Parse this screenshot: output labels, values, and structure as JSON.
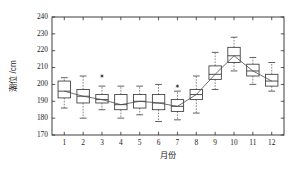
{
  "chart_data": {
    "type": "box",
    "title": "",
    "xlabel": "月份",
    "ylabel": "潮位 /cm",
    "xlim": [
      0.35,
      12.65
    ],
    "ylim": [
      170,
      240
    ],
    "yticks": [
      170,
      180,
      190,
      200,
      210,
      220,
      230,
      240
    ],
    "xticks": [
      1,
      2,
      3,
      4,
      5,
      6,
      7,
      8,
      9,
      10,
      11,
      12
    ],
    "xtick_labels": [
      "1",
      "2",
      "3",
      "4",
      "5",
      "6",
      "7",
      "8",
      "9",
      "10",
      "11",
      "12"
    ],
    "ytick_labels": [
      "170",
      "180",
      "190",
      "200",
      "210",
      "220",
      "230",
      "240"
    ],
    "grid": false,
    "legend": null,
    "categories": [
      "1",
      "2",
      "3",
      "4",
      "5",
      "6",
      "7",
      "8",
      "9",
      "10",
      "11",
      "12"
    ],
    "boxes": [
      {
        "category": "1",
        "whisker_low": 186,
        "q1": 192,
        "median": 196,
        "q3": 202,
        "whisker_high": 204,
        "outliers": []
      },
      {
        "category": "2",
        "whisker_low": 180,
        "q1": 189,
        "median": 193,
        "q3": 197,
        "whisker_high": 205,
        "outliers": []
      },
      {
        "category": "3",
        "whisker_low": 185,
        "q1": 189,
        "median": 191,
        "q3": 194,
        "whisker_high": 199,
        "outliers": [
          205
        ]
      },
      {
        "category": "4",
        "whisker_low": 180,
        "q1": 185,
        "median": 188,
        "q3": 194,
        "whisker_high": 199,
        "outliers": []
      },
      {
        "category": "5",
        "whisker_low": 182,
        "q1": 186,
        "median": 190,
        "q3": 194,
        "whisker_high": 199,
        "outliers": []
      },
      {
        "category": "6",
        "whisker_low": 178,
        "q1": 185,
        "median": 189,
        "q3": 194,
        "whisker_high": 200,
        "outliers": []
      },
      {
        "category": "7",
        "whisker_low": 179,
        "q1": 184,
        "median": 187,
        "q3": 191,
        "whisker_high": 196,
        "outliers": [
          199
        ]
      },
      {
        "category": "8",
        "whisker_low": 183,
        "q1": 191,
        "median": 194,
        "q3": 197,
        "whisker_high": 205,
        "outliers": []
      },
      {
        "category": "9",
        "whisker_low": 197,
        "q1": 203,
        "median": 206,
        "q3": 211,
        "whisker_high": 219,
        "outliers": []
      },
      {
        "category": "10",
        "whisker_low": 208,
        "q1": 213,
        "median": 217,
        "q3": 222,
        "whisker_high": 228,
        "outliers": []
      },
      {
        "category": "11",
        "whisker_low": 200,
        "q1": 205,
        "median": 208,
        "q3": 212,
        "whisker_high": 216,
        "outliers": []
      },
      {
        "category": "12",
        "whisker_low": 196,
        "q1": 199,
        "median": 202,
        "q3": 206,
        "whisker_high": 213,
        "outliers": []
      }
    ],
    "median_trend": {
      "name": "median",
      "x": [
        1,
        2,
        3,
        4,
        5,
        6,
        7,
        8,
        9,
        10,
        11,
        12
      ],
      "values": [
        196,
        193,
        191,
        188,
        190,
        189,
        187,
        194,
        206,
        217,
        208,
        202
      ]
    },
    "colors": {
      "axis": "#2b2b2b",
      "box": "#3a3a3a",
      "whisker": "#5a5a5a",
      "median": "#3a3a3a",
      "trend": "#4a4a4a",
      "outlier": "#2b2b2b",
      "background": "#ffffff"
    }
  }
}
